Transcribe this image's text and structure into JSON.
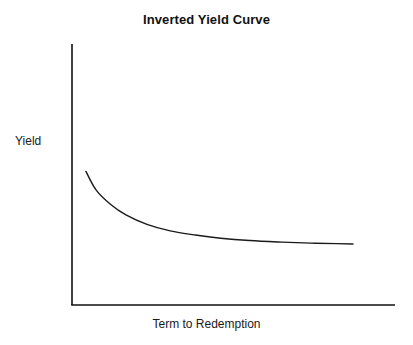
{
  "figure": {
    "background_color": "#ffffff",
    "width": 413,
    "height": 345
  },
  "chart_data": {
    "type": "line",
    "title": "Inverted Yield Curve",
    "subtitle": "",
    "xlabel": "Term to Redemption",
    "ylabel": "Yield",
    "grid": false,
    "legend": false,
    "legend_position": "none",
    "xticks": [],
    "yticks": [],
    "xtick_labels": [],
    "ytick_labels": [],
    "xlim": [
      0,
      1
    ],
    "ylim": [
      0,
      1
    ],
    "annotations": [],
    "series": [
      {
        "name": "Inverted yield curve",
        "color": "#1a1a1a",
        "line_width": 1.4,
        "x": [
          0.043,
          0.075,
          0.118,
          0.167,
          0.232,
          0.304,
          0.382,
          0.46,
          0.55,
          0.65,
          0.74,
          0.82,
          0.87
        ],
        "y": [
          0.512,
          0.44,
          0.387,
          0.345,
          0.309,
          0.284,
          0.268,
          0.256,
          0.247,
          0.241,
          0.237,
          0.235,
          0.234
        ]
      }
    ],
    "axes": {
      "y_axis_color": "#111111",
      "x_axis_color": "#111111",
      "axis_line_width": 1.6,
      "spines": [
        "left",
        "bottom"
      ]
    }
  }
}
